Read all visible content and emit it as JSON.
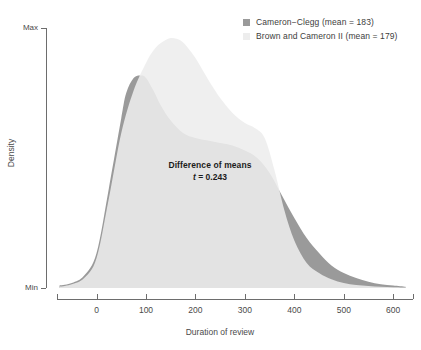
{
  "chart_data": {
    "type": "area",
    "title": "",
    "xlabel": "Duration of review",
    "ylabel": "Density",
    "xlim": [
      -80,
      640
    ],
    "ylim": [
      0,
      1
    ],
    "grid": false,
    "legend_position": "top-right",
    "x_ticks": [
      0,
      100,
      200,
      300,
      400,
      500,
      600
    ],
    "x_tick_labels": [
      "0",
      "100",
      "200",
      "300",
      "400",
      "500",
      "600"
    ],
    "y_ticks": [
      0,
      1
    ],
    "y_tick_labels": [
      "Min",
      "Max"
    ],
    "annotation": {
      "line1": "Difference of means",
      "line2_stat": "t",
      "line2_rest": " = 0.243",
      "t_value": 0.243
    },
    "series": [
      {
        "name": "Cameron−Clegg",
        "mean": 183,
        "legend_label": "Cameron−Clegg (mean = 183)",
        "color": "#9a9a9a",
        "x": [
          -75,
          -50,
          -25,
          0,
          25,
          50,
          60,
          75,
          90,
          100,
          115,
          130,
          150,
          175,
          200,
          225,
          250,
          275,
          300,
          325,
          350,
          375,
          400,
          425,
          450,
          475,
          500,
          525,
          550,
          575,
          600,
          625
        ],
        "y": [
          0.01,
          0.02,
          0.05,
          0.14,
          0.4,
          0.68,
          0.78,
          0.84,
          0.85,
          0.84,
          0.79,
          0.73,
          0.67,
          0.62,
          0.6,
          0.59,
          0.58,
          0.57,
          0.55,
          0.52,
          0.46,
          0.37,
          0.28,
          0.2,
          0.14,
          0.09,
          0.06,
          0.04,
          0.025,
          0.015,
          0.01,
          0.005
        ]
      },
      {
        "name": "Brown and Cameron II",
        "mean": 179,
        "legend_label": "Brown and Cameron II (mean = 179)",
        "color": "#ededed",
        "x": [
          -75,
          -50,
          -25,
          0,
          25,
          50,
          75,
          100,
          115,
          130,
          150,
          170,
          185,
          200,
          215,
          230,
          250,
          275,
          300,
          320,
          340,
          360,
          380,
          400,
          425,
          450,
          475,
          500,
          525,
          550,
          575,
          600,
          625
        ],
        "y": [
          0.005,
          0.015,
          0.04,
          0.12,
          0.36,
          0.62,
          0.79,
          0.9,
          0.95,
          0.98,
          1.0,
          0.99,
          0.96,
          0.92,
          0.87,
          0.82,
          0.76,
          0.7,
          0.66,
          0.64,
          0.6,
          0.47,
          0.31,
          0.19,
          0.1,
          0.06,
          0.035,
          0.02,
          0.012,
          0.008,
          0.005,
          0.003,
          0.002
        ]
      }
    ],
    "overlap_color": "#dedede"
  },
  "legend": {
    "items": [
      {
        "label": "Cameron−Clegg (mean = 183)",
        "swatch": "dark"
      },
      {
        "label": "Brown and Cameron II (mean = 179)",
        "swatch": "light"
      }
    ]
  },
  "axes": {
    "y_title": "Density",
    "y_max_label": "Max",
    "y_min_label": "Min",
    "x_title": "Duration of review"
  }
}
